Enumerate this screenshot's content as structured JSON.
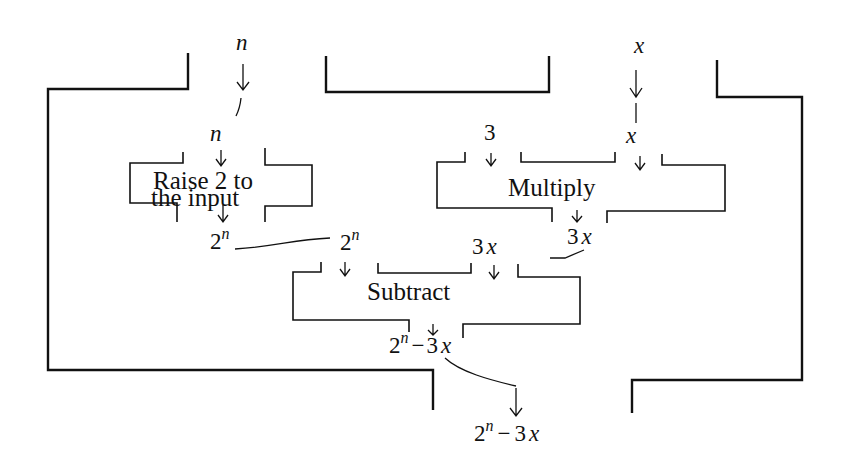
{
  "diagram": {
    "type": "function machine composition",
    "outer_machine": {
      "inputs": [
        "n",
        "x"
      ],
      "output": "2^n − 3x"
    },
    "machines": [
      {
        "id": "raise",
        "label_line1": "Raise 2 to",
        "label_line2": "the input",
        "inputs": [
          "n"
        ],
        "output": "2^n"
      },
      {
        "id": "multiply",
        "label": "Multiply",
        "inputs": [
          "3",
          "x"
        ],
        "output": "3x"
      },
      {
        "id": "subtract",
        "label": "Subtract",
        "inputs": [
          "2^n",
          "3x"
        ],
        "output": "2^n − 3x"
      }
    ],
    "labels": {
      "outer_input_n": "n",
      "outer_input_x": "x",
      "raise_input_n": "n",
      "const_3": "3",
      "mult_input_x": "x",
      "raise_output_base": "2",
      "sup_n": "n",
      "mult_output_3": "3",
      "mult_output_x": "x",
      "sub_input_3": "3",
      "sub_input_x": "x",
      "minus": "−",
      "final_output_base": "2",
      "final_output_rest": "3x"
    }
  }
}
